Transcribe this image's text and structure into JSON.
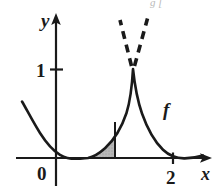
{
  "figure": {
    "title_fragment": "g [",
    "caption_visible": false,
    "background_color": "#ffffff",
    "ink_color": "#1a1a1a",
    "shade_color": "#a8a8a8",
    "axes": {
      "x_axis_label": "x",
      "y_axis_label": "y",
      "origin_label": "0",
      "x_ticks": [
        {
          "label": "2",
          "value": 2
        }
      ],
      "y_ticks": [
        {
          "label": "1",
          "value": 1
        }
      ],
      "x_range": [
        -0.55,
        2.65
      ],
      "y_range": [
        -0.45,
        1.6
      ]
    },
    "curve": {
      "label": "f",
      "description": "decreasing-then-rising curve with a corner peak at x=1.5, y=1, decaying to zero at the right",
      "peak": {
        "x": 1.5,
        "y": 1.0
      },
      "points": [
        {
          "x": -0.5,
          "y": 0.78
        },
        {
          "x": -0.38,
          "y": 0.6
        },
        {
          "x": -0.25,
          "y": 0.42
        },
        {
          "x": -0.12,
          "y": 0.24
        },
        {
          "x": 0.0,
          "y": 0.12
        },
        {
          "x": 0.12,
          "y": 0.045
        },
        {
          "x": 0.25,
          "y": 0.01
        },
        {
          "x": 0.38,
          "y": 0.0
        },
        {
          "x": 0.5,
          "y": 0.015
        },
        {
          "x": 0.62,
          "y": 0.06
        },
        {
          "x": 0.75,
          "y": 0.13
        },
        {
          "x": 0.88,
          "y": 0.22
        },
        {
          "x": 1.0,
          "y": 0.33
        },
        {
          "x": 1.12,
          "y": 0.47
        },
        {
          "x": 1.25,
          "y": 0.63
        },
        {
          "x": 1.38,
          "y": 0.82
        },
        {
          "x": 1.5,
          "y": 1.0
        },
        {
          "x": 1.62,
          "y": 0.76
        },
        {
          "x": 1.75,
          "y": 0.55
        },
        {
          "x": 1.88,
          "y": 0.38
        },
        {
          "x": 2.0,
          "y": 0.24
        },
        {
          "x": 2.12,
          "y": 0.14
        },
        {
          "x": 2.25,
          "y": 0.07
        },
        {
          "x": 2.4,
          "y": 0.03
        },
        {
          "x": 2.6,
          "y": 0.015
        }
      ]
    },
    "shaded_region": {
      "fill": "#a8a8a8",
      "x_from": 0.38,
      "x_to": 1.0,
      "description": "hatched/shaded area under the curve between the zero point and x = 1"
    },
    "vertical_boundary": {
      "x": 1.0,
      "y_top": 0.33,
      "y_bottom": 0.0
    },
    "dashed_lines": [
      {
        "name": "left-tangent-dashed",
        "from": {
          "x": 1.5,
          "y": 1.0
        },
        "to": {
          "x": 1.33,
          "y": 1.5
        }
      },
      {
        "name": "right-tangent-dashed",
        "from": {
          "x": 1.5,
          "y": 1.0
        },
        "to": {
          "x": 1.71,
          "y": 1.53
        }
      }
    ]
  }
}
